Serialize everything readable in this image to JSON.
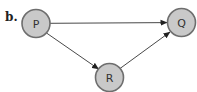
{
  "panel_label": "b.",
  "nodes": [
    {
      "id": "P",
      "label": "P",
      "cx": 36,
      "cy": 23.5,
      "r": 14
    },
    {
      "id": "Q",
      "label": "Q",
      "cx": 181.5,
      "cy": 22.5,
      "r": 14
    },
    {
      "id": "R",
      "label": "R",
      "cx": 109.5,
      "cy": 77.5,
      "r": 14
    }
  ],
  "edges": [
    {
      "from": "P",
      "to": "Q"
    },
    {
      "from": "P",
      "to": "R"
    },
    {
      "from": "R",
      "to": "Q"
    }
  ],
  "colors": {
    "node_fill": "#c9c9c9",
    "node_stroke": "#6e6e6e",
    "edge": "#333333"
  }
}
